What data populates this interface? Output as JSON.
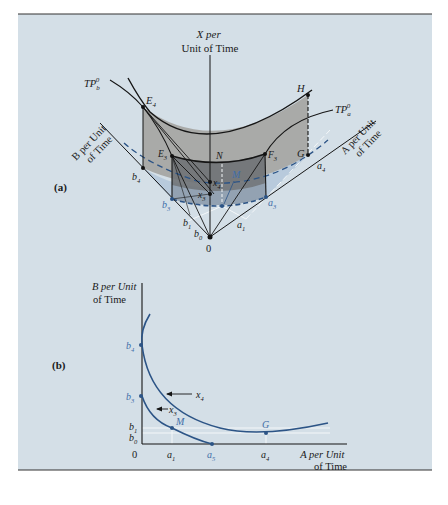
{
  "colors": {
    "panel_bg": "#d4dfe7",
    "surface_light": "#a7a7a4",
    "surface_dark": "#6f7276",
    "shadow_blue": "#b3c7d9",
    "curve_blue": "#2c5486",
    "line": "#151515",
    "white_guide": "#f4f7f9"
  },
  "panel_a": {
    "label": "(a)",
    "x_axis_label_line1": "X per",
    "x_axis_label_line2": "Unit of Time",
    "b_axis_label_line1": "B per Unit",
    "b_axis_label_line2": "of Time",
    "a_axis_label_line1": "A per Unit",
    "a_axis_label_line2": "of Time",
    "tp_b": {
      "base": "TP",
      "sub": "b",
      "sup": "0"
    },
    "tp_a": {
      "base": "TP",
      "sub": "a",
      "sup": "0"
    },
    "points": {
      "E4": {
        "base": "E",
        "sub": "4"
      },
      "E3": {
        "base": "E",
        "sub": "3"
      },
      "N": "N",
      "F3": {
        "base": "F",
        "sub": "3"
      },
      "H": "H",
      "G": "G",
      "M": "M",
      "x4": {
        "base": "x",
        "sub": "4"
      },
      "x3": {
        "base": "x",
        "sub": "3"
      },
      "b4": {
        "base": "b",
        "sub": "4"
      },
      "b3": {
        "base": "b",
        "sub": "3"
      },
      "b1": {
        "base": "b",
        "sub": "1"
      },
      "b0": {
        "base": "b",
        "sub": "0"
      },
      "a4": {
        "base": "a",
        "sub": "4"
      },
      "a3": {
        "base": "a",
        "sub": "3"
      },
      "a1": {
        "base": "a",
        "sub": "1"
      },
      "origin": "0"
    }
  },
  "panel_b": {
    "label": "(b)",
    "y_axis_label_line1": "B per Unit",
    "y_axis_label_line2": "of Time",
    "x_axis_label_line1": "A per Unit",
    "x_axis_label_line2": "of Time",
    "curves": [
      {
        "name": "x4",
        "label": {
          "base": "x",
          "sub": "4"
        }
      },
      {
        "name": "x3",
        "label": {
          "base": "x",
          "sub": "3"
        }
      }
    ],
    "y_ticks": [
      {
        "base": "b",
        "sub": "4"
      },
      {
        "base": "b",
        "sub": "3"
      },
      {
        "base": "b",
        "sub": "1"
      },
      {
        "base": "b",
        "sub": "0"
      }
    ],
    "x_ticks": [
      {
        "text": "0"
      },
      {
        "base": "a",
        "sub": "1"
      },
      {
        "base": "a",
        "sub": "5"
      },
      {
        "base": "a",
        "sub": "4"
      }
    ],
    "points": {
      "M": "M",
      "G": "G"
    }
  }
}
